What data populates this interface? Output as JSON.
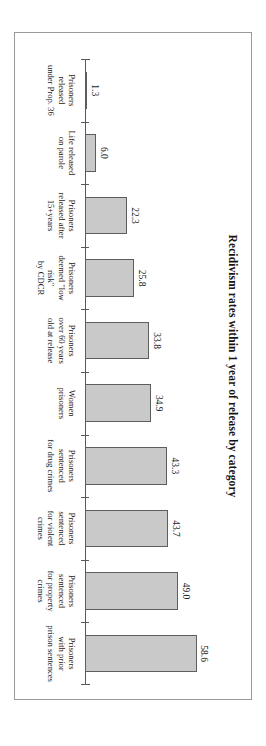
{
  "chart_data": {
    "type": "bar",
    "orientation": "vertical",
    "title": "Recidivism rates within 1 year of release by category",
    "xlabel": "",
    "ylabel": "",
    "ylim": [
      0,
      62
    ],
    "grid": false,
    "legend": "none",
    "categories": [
      "Prisoners\nreleased\nunder Prop. 36",
      "Life released\non parole",
      "Prisoners\nreleased after\n15+years",
      "Prisoners\ndeemed \"low risk\"\nby CDCR",
      "Prisoners\nover 60 years\nold at release",
      "Women\nprisoners",
      "Prisoners\nsentenced\nfor drug crimes",
      "Prisoners\nsentenced\nfor violent\ncrimes",
      "Prisoners\nsentenced\nfor property\ncrimes",
      "Prisoners\nwith prior\nprison sentences"
    ],
    "values": [
      1.3,
      6.0,
      22.3,
      25.8,
      33.8,
      34.9,
      43.3,
      43.7,
      49.0,
      58.6
    ],
    "value_labels": [
      "1.3",
      "6.0",
      "22.3",
      "25.8",
      "33.8",
      "34.9",
      "43.3",
      "43.7",
      "49.0",
      "58.6"
    ],
    "bar_fill_color": "#c9c9c9",
    "bar_border_color": "#5d5d5d",
    "axis_color": "#5a5a5a",
    "frame_color": "#9a9a9a",
    "background_color": "#ffffff"
  }
}
